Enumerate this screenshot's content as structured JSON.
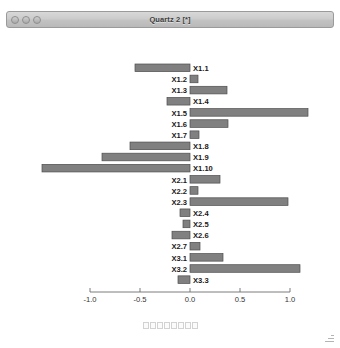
{
  "window": {
    "title": "Quartz 2 [*]",
    "traffic_lights": [
      {
        "name": "close-button",
        "label": "Close"
      },
      {
        "name": "minimize-button",
        "label": "Minimize"
      },
      {
        "name": "zoom-button",
        "label": "Zoom"
      }
    ]
  },
  "toolbar": {
    "items": [
      "tool-1",
      "tool-2",
      "tool-3",
      "tool-4",
      "tool-5",
      "tool-6",
      "tool-7",
      "tool-8"
    ]
  },
  "colors": {
    "bar_fill": "#808080",
    "bar_stroke": "#4d4d4d",
    "axis": "#6e6e6e",
    "label_text": "#1a1a1a",
    "tick_text": "#333333",
    "titlebar_border": "#9a9a9a"
  },
  "chart_data": {
    "type": "bar",
    "orientation": "horizontal",
    "title": "",
    "subtitle": "",
    "xlabel": "",
    "ylabel": "",
    "xlim": [
      -1.0,
      1.0
    ],
    "xticks": [
      -1.0,
      -0.5,
      0.0,
      0.5,
      1.0
    ],
    "xticklabels": [
      "-1.0",
      "-0.5",
      "0.0",
      "0.5",
      "1.0"
    ],
    "grid": false,
    "legend": false,
    "categories": [
      "X1.1",
      "X1.2",
      "X1.3",
      "X1.4",
      "X1.5",
      "X1.6",
      "X1.7",
      "X1.8",
      "X1.9",
      "X1.10",
      "X2.1",
      "X2.2",
      "X2.3",
      "X2.4",
      "X2.5",
      "X2.6",
      "X2.7",
      "X3.1",
      "X3.2",
      "X3.3"
    ],
    "values": [
      -0.55,
      0.08,
      0.37,
      -0.23,
      1.18,
      0.38,
      0.09,
      -0.6,
      -0.88,
      -1.48,
      0.3,
      0.08,
      0.98,
      -0.1,
      -0.07,
      -0.18,
      0.1,
      0.33,
      1.1,
      -0.12
    ]
  }
}
